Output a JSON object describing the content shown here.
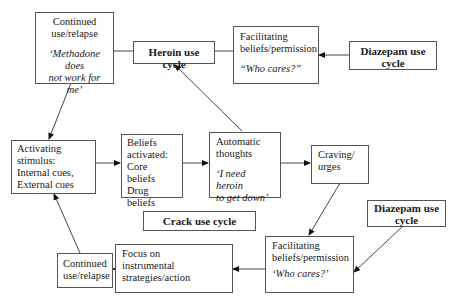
{
  "nodes": {
    "relapse_top": {
      "line1": "Continued",
      "line2": "use/relapse",
      "quote1": "‘Methadone does",
      "quote2": "not work for me’"
    },
    "heroin_cycle": {
      "label": "Heroin use cycle"
    },
    "facilitating_top": {
      "line1": "Facilitating",
      "line2": "beliefs/permission",
      "quote": "“Who cares?”"
    },
    "diazepam_top": {
      "line1": "Diazepam use",
      "line2": "cycle"
    },
    "activating": {
      "line1": "Activating",
      "line2": "stimulus:",
      "line3": "Internal cues,",
      "line4": "External cues"
    },
    "beliefs": {
      "line1": "Beliefs",
      "line2": "activated:",
      "line3": "Core beliefs",
      "line4": "Drug beliefs"
    },
    "automatic": {
      "line1": "Automatic",
      "line2": "thoughts",
      "quote1": "‘I need heroin",
      "quote2": "to get down’"
    },
    "craving": {
      "line1": "Craving/",
      "line2": "urges"
    },
    "crack_cycle": {
      "label": "Crack use cycle"
    },
    "diazepam_bottom": {
      "line1": "Diazepam use",
      "line2": "cycle"
    },
    "facilitating_bottom": {
      "line1": "Facilitating",
      "line2": "beliefs/permission",
      "quote": "‘Who cares?’"
    },
    "focus": {
      "line1": "Focus on",
      "line2": "instrumental",
      "line3": "strategies/action"
    },
    "relapse_bottom": {
      "line1": "Continued",
      "line2": "use/relapse"
    }
  },
  "edges": [
    {
      "from": "relapse_top",
      "to": "activating"
    },
    {
      "from": "activating",
      "to": "beliefs"
    },
    {
      "from": "beliefs",
      "to": "automatic"
    },
    {
      "from": "automatic",
      "to": "heroin_cycle"
    },
    {
      "from": "automatic",
      "to": "craving"
    },
    {
      "from": "craving",
      "to": "facilitating_bottom"
    },
    {
      "from": "diazepam_bottom",
      "to": "facilitating_bottom"
    },
    {
      "from": "facilitating_bottom",
      "to": "focus"
    },
    {
      "from": "focus",
      "to": "relapse_bottom"
    },
    {
      "from": "relapse_bottom",
      "to": "activating"
    },
    {
      "from": "diazepam_top",
      "to": "facilitating_top"
    },
    {
      "from": "facilitating_top",
      "to": "heroin_cycle",
      "type": "line"
    },
    {
      "from": "heroin_cycle",
      "to": "relapse_top",
      "type": "line"
    }
  ]
}
